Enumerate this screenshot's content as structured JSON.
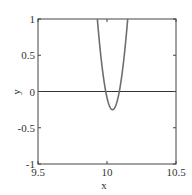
{
  "chart_data": {
    "type": "line",
    "title": "",
    "xlabel": "x",
    "ylabel": "y",
    "xlim": [
      9.5,
      10.5
    ],
    "ylim": [
      -1,
      1
    ],
    "xticks": [
      9.5,
      10,
      10.5
    ],
    "xtick_labels": [
      "9.5",
      "10",
      "10.5"
    ],
    "yticks": [
      -1,
      -0.5,
      0,
      0.5,
      1
    ],
    "ytick_labels": [
      "-1",
      "-0.5",
      "0",
      "0.5",
      "1"
    ],
    "grid": false,
    "legend": null,
    "series": [
      {
        "name": "curve",
        "color": "#6e6e6e",
        "description": "upward parabola with minimum near (10.04, -0.25)",
        "x": [
          9.93,
          9.96,
          10.0,
          10.02,
          10.04,
          10.06,
          10.09,
          10.12,
          10.15
        ],
        "y": [
          1.0,
          0.55,
          0.0,
          -0.19,
          -0.25,
          -0.19,
          0.0,
          0.5,
          1.0
        ]
      },
      {
        "name": "zero-line",
        "color": "#333333",
        "x": [
          9.5,
          10.5
        ],
        "y": [
          0,
          0
        ]
      }
    ]
  }
}
